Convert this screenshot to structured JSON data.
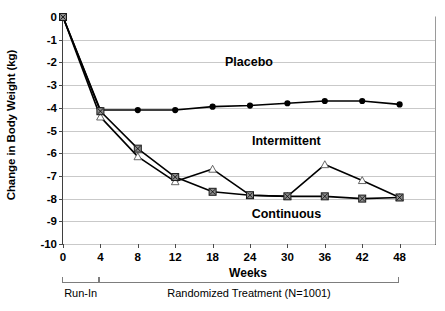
{
  "chart_data": {
    "type": "line",
    "title": "",
    "xlabel": "Weeks",
    "ylabel": "Change in Body Weight (kg)",
    "categories": [
      "0",
      "4",
      "8",
      "12",
      "18",
      "24",
      "30",
      "36",
      "42",
      "48"
    ],
    "x_tick_labels": [
      "0",
      "4",
      "8",
      "12",
      "18",
      "24",
      "30",
      "36",
      "42",
      "48"
    ],
    "y_tick_labels": [
      "0",
      "-1",
      "-2",
      "-3",
      "-4",
      "-5",
      "-6",
      "-7",
      "-8",
      "-9",
      "-10"
    ],
    "ylim": [
      -10,
      0
    ],
    "grid": "horizontal",
    "legend_position": "inline-annotations",
    "series": [
      {
        "name": "Placebo",
        "marker": "filled-circle",
        "color": "#000000",
        "values": [
          0,
          -4.1,
          -4.1,
          -4.1,
          -3.95,
          -3.9,
          -3.8,
          -3.7,
          -3.7,
          -3.85
        ]
      },
      {
        "name": "Intermittent",
        "marker": "open-triangle",
        "color": "#000000",
        "values": [
          0,
          -4.4,
          -6.15,
          -7.25,
          -6.7,
          -7.85,
          -7.9,
          -6.5,
          -7.2,
          -7.95
        ]
      },
      {
        "name": "Continuous",
        "marker": "gray-square-x",
        "color": "#000000",
        "values": [
          0,
          -4.15,
          -5.8,
          -7.05,
          -7.7,
          -7.85,
          -7.9,
          -7.9,
          -8.0,
          -7.95
        ]
      }
    ],
    "annotations": [
      {
        "text": "Placebo",
        "category": "24",
        "value": -2.05
      },
      {
        "text": "Intermittent",
        "category": "30",
        "value": -5.55
      },
      {
        "text": "Continuous",
        "category": "30",
        "value": -8.75
      }
    ],
    "phase_brackets": [
      {
        "label": "Run-In",
        "from": "0",
        "to": "4"
      },
      {
        "label": "Randomized Treatment (N=1001)",
        "from": "4",
        "to": "48"
      }
    ]
  },
  "colors": {
    "gridline": "#c9c9c9",
    "axis": "#3f3f3f",
    "marker_square_fill": "#8c8c8c",
    "text": "#000000"
  }
}
